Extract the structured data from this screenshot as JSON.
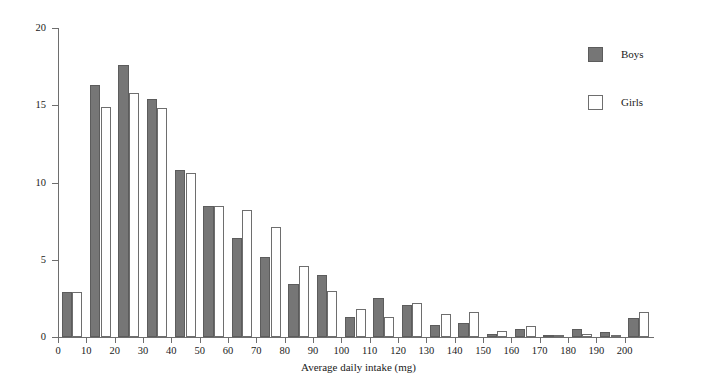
{
  "chart_data": {
    "type": "bar",
    "title": "",
    "xlabel": "Average daily intake (mg)",
    "ylabel": "Percentage",
    "xlim": [
      0,
      210
    ],
    "ylim": [
      0,
      20
    ],
    "xticks": [
      0,
      10,
      20,
      30,
      40,
      50,
      60,
      70,
      80,
      90,
      100,
      110,
      120,
      130,
      140,
      150,
      160,
      170,
      180,
      190,
      200
    ],
    "yticks": [
      0,
      5,
      10,
      15,
      20
    ],
    "grid": false,
    "legend_position": "top-right",
    "bin_width": 10,
    "bin_starts": [
      0,
      10,
      20,
      30,
      40,
      50,
      60,
      70,
      80,
      90,
      100,
      110,
      120,
      130,
      140,
      150,
      160,
      170,
      180,
      190,
      200
    ],
    "categories": [
      "0-10",
      "10-20",
      "20-30",
      "30-40",
      "40-50",
      "50-60",
      "60-70",
      "70-80",
      "80-90",
      "90-100",
      "100-110",
      "110-120",
      "120-130",
      "130-140",
      "140-150",
      "150-160",
      "160-170",
      "170-180",
      "180-190",
      "190-200",
      "200-210"
    ],
    "series": [
      {
        "name": "Boys",
        "color": "#767676",
        "values": [
          2.9,
          16.3,
          17.6,
          15.4,
          10.8,
          8.5,
          6.4,
          5.2,
          3.4,
          4.0,
          1.3,
          2.5,
          2.1,
          0.8,
          0.9,
          0.2,
          0.5,
          0.1,
          0.5,
          0.3,
          1.2
        ]
      },
      {
        "name": "Girls",
        "color": "#ffffff",
        "values": [
          2.9,
          14.9,
          15.8,
          14.8,
          10.6,
          8.5,
          8.2,
          7.1,
          4.6,
          3.0,
          1.8,
          1.3,
          2.2,
          1.5,
          1.6,
          0.4,
          0.7,
          0.1,
          0.2,
          0.1,
          1.6
        ]
      }
    ]
  },
  "legend": {
    "items": [
      {
        "label": "Boys",
        "swatch": "filled-gray-square"
      },
      {
        "label": "Girls",
        "swatch": "open-white-square"
      }
    ]
  }
}
